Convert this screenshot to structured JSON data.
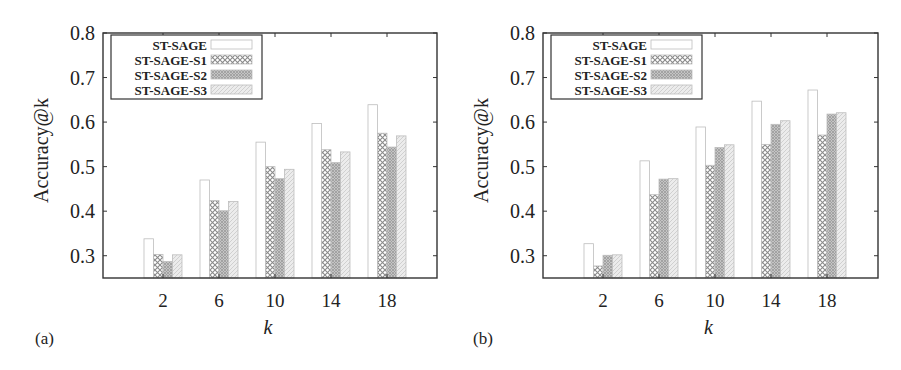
{
  "figure": {
    "panels": [
      "(a)",
      "(b)"
    ]
  },
  "chart_data": [
    {
      "type": "bar",
      "panel_label": "(a)",
      "title": "",
      "xlabel": "k",
      "ylabel": "Accuracy@k",
      "ylim": [
        0.25,
        0.8
      ],
      "yticks": [
        0.3,
        0.4,
        0.5,
        0.6,
        0.7,
        0.8
      ],
      "ytick_labels": [
        "0.3",
        "0.4",
        "0.5",
        "0.6",
        "0.7",
        "0.8"
      ],
      "categories": [
        "2",
        "6",
        "10",
        "14",
        "18"
      ],
      "grid": false,
      "legend_position": "upper left",
      "series": [
        {
          "name": "ST-SAGE",
          "pattern": "empty",
          "values": [
            0.338,
            0.47,
            0.555,
            0.597,
            0.639
          ]
        },
        {
          "name": "ST-SAGE-S1",
          "pattern": "crosshatch",
          "values": [
            0.303,
            0.424,
            0.5,
            0.538,
            0.575
          ]
        },
        {
          "name": "ST-SAGE-S2",
          "pattern": "dense",
          "values": [
            0.287,
            0.401,
            0.473,
            0.509,
            0.544
          ]
        },
        {
          "name": "ST-SAGE-S3",
          "pattern": "light",
          "values": [
            0.302,
            0.422,
            0.494,
            0.533,
            0.569
          ]
        }
      ]
    },
    {
      "type": "bar",
      "panel_label": "(b)",
      "title": "",
      "xlabel": "k",
      "ylabel": "Accuracy@k",
      "ylim": [
        0.25,
        0.8
      ],
      "yticks": [
        0.3,
        0.4,
        0.5,
        0.6,
        0.7,
        0.8
      ],
      "ytick_labels": [
        "0.3",
        "0.4",
        "0.5",
        "0.6",
        "0.7",
        "0.8"
      ],
      "categories": [
        "2",
        "6",
        "10",
        "14",
        "18"
      ],
      "grid": false,
      "legend_position": "upper left",
      "series": [
        {
          "name": "ST-SAGE",
          "pattern": "empty",
          "values": [
            0.327,
            0.513,
            0.589,
            0.647,
            0.672
          ]
        },
        {
          "name": "ST-SAGE-S1",
          "pattern": "crosshatch",
          "values": [
            0.277,
            0.437,
            0.503,
            0.55,
            0.571
          ]
        },
        {
          "name": "ST-SAGE-S2",
          "pattern": "dense",
          "values": [
            0.301,
            0.472,
            0.543,
            0.595,
            0.618
          ]
        },
        {
          "name": "ST-SAGE-S3",
          "pattern": "light",
          "values": [
            0.302,
            0.473,
            0.549,
            0.603,
            0.621
          ]
        }
      ]
    }
  ],
  "colors": {
    "frame": "#333333",
    "bar_outline": "#bdbdbd",
    "crosshatch": "#8a8a8a",
    "dense": "#9a9a9a",
    "light": "#d0d0d0",
    "text": "#222222"
  }
}
